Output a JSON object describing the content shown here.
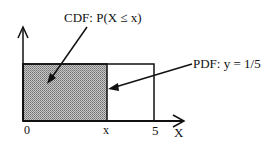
{
  "diagram": {
    "labels": {
      "cdf": "CDF: P(X ≤ x)",
      "pdf": "PDF: y = 1/5",
      "origin": "0",
      "x_marker": "x",
      "upper": "5",
      "axis": "X"
    },
    "colors": {
      "line": "#111111",
      "shade": "#a8a8a8",
      "background": "#ffffff"
    }
  }
}
